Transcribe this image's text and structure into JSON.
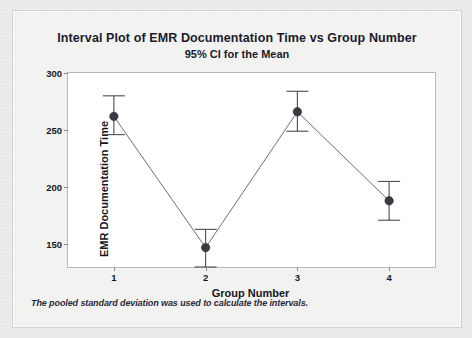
{
  "chart_data": {
    "type": "line",
    "title": "Interval Plot of EMR Documentation Time vs Group Number",
    "subtitle": "95% CI for the Mean",
    "footnote": "The pooled standard deviation was used to calculate the intervals.",
    "xlabel": "Group Number",
    "ylabel": "EMR Documentation Time",
    "categories": [
      "1",
      "2",
      "3",
      "4"
    ],
    "x": [
      1,
      2,
      3,
      4
    ],
    "values": [
      262,
      147,
      266,
      188
    ],
    "ci_lower": [
      246,
      130,
      249,
      171
    ],
    "ci_upper": [
      280,
      163,
      284,
      205
    ],
    "series": [
      {
        "name": "Mean",
        "values": [
          262,
          147,
          266,
          188
        ]
      }
    ],
    "yticks": [
      300,
      250,
      200,
      150
    ],
    "ylim": [
      130,
      300
    ],
    "xlim": [
      0.5,
      4.5
    ],
    "grid": false,
    "legend": "none",
    "marker_color": "#3a3a45",
    "line_color": "#6e6e78",
    "interval_color": "#4a4a55",
    "plot_background": "#ffffff",
    "page_background": "#f2f2f1"
  }
}
